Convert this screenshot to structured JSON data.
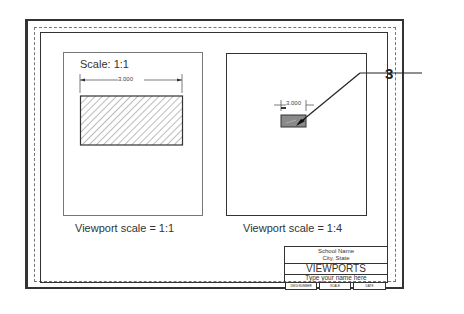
{
  "figure": {
    "callout_number": "3",
    "left_viewport": {
      "scale_label": "Scale: 1:1",
      "dimension": "3.000",
      "caption": "Viewport scale = 1:1"
    },
    "right_viewport": {
      "dimension": "3.000",
      "caption": "Viewport scale = 1:4"
    },
    "title_block": {
      "school": "School Name",
      "city": "City, State",
      "title": "VIEWPORTS",
      "name_prompt": "Type your name here",
      "fields": [
        "DWG NUMBER",
        "SCALE",
        "DATE"
      ]
    }
  }
}
